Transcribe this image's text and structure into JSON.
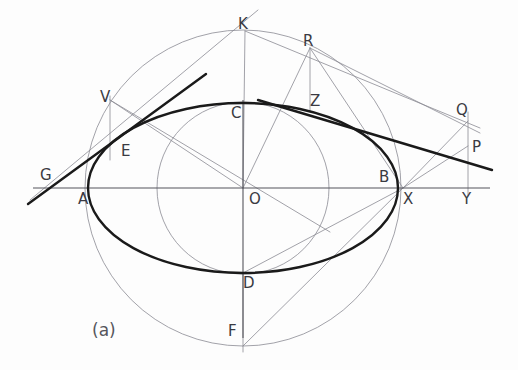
{
  "figure": {
    "caption": "(a)",
    "caption_x": 92,
    "caption_y": 322,
    "width": 518,
    "height": 370,
    "background": "#fdfdfd"
  },
  "style": {
    "bold_stroke": "#1a1a1a",
    "thin_stroke": "#8a8a93",
    "medium_stroke": "#55555c",
    "label_color": "#3a3a42",
    "bold_width": 2.4,
    "thin_width": 0.8,
    "medium_width": 1.1
  },
  "geometry": {
    "center": {
      "x": 243,
      "y": 188,
      "label": "O"
    },
    "ellipse": {
      "cx": 243,
      "cy": 188,
      "rx": 155,
      "ry": 85
    },
    "major_circle": {
      "cx": 243,
      "cy": 188,
      "r": 158
    },
    "minor_circle": {
      "cx": 243,
      "cy": 188,
      "r": 86
    },
    "axis_horizontal": {
      "x1": 33,
      "y1": 188,
      "x2": 490,
      "y2": 188
    },
    "axis_vertical": {
      "x1": 243,
      "y1": 100,
      "x2": 243,
      "y2": 338
    }
  },
  "points": [
    {
      "name": "A",
      "x": 88,
      "y": 188,
      "label_x": 78,
      "label_y": 192
    },
    {
      "name": "B",
      "x": 398,
      "y": 188,
      "label_x": 379,
      "label_y": 170
    },
    {
      "name": "C",
      "x": 243,
      "y": 103,
      "label_x": 231,
      "label_y": 106
    },
    {
      "name": "D",
      "x": 243,
      "y": 273,
      "label_x": 243,
      "label_y": 276
    },
    {
      "name": "E",
      "x": 118,
      "y": 142,
      "label_x": 121,
      "label_y": 144
    },
    {
      "name": "F",
      "x": 243,
      "y": 346,
      "label_x": 228,
      "label_y": 324
    },
    {
      "name": "G",
      "x": 45,
      "y": 182,
      "label_x": 40,
      "label_y": 168
    },
    {
      "name": "K",
      "x": 245,
      "y": 31,
      "label_x": 238,
      "label_y": 17
    },
    {
      "name": "O",
      "x": 243,
      "y": 188,
      "label_x": 249,
      "label_y": 192
    },
    {
      "name": "P",
      "x": 468,
      "y": 146,
      "label_x": 472,
      "label_y": 140
    },
    {
      "name": "Q",
      "x": 468,
      "y": 121,
      "label_x": 456,
      "label_y": 103
    },
    {
      "name": "R",
      "x": 310,
      "y": 48,
      "label_x": 303,
      "label_y": 34
    },
    {
      "name": "V",
      "x": 110,
      "y": 100,
      "label_x": 100,
      "label_y": 90
    },
    {
      "name": "X",
      "x": 403,
      "y": 188,
      "label_x": 403,
      "label_y": 192
    },
    {
      "name": "Y",
      "x": 468,
      "y": 188,
      "label_x": 462,
      "label_y": 192
    },
    {
      "name": "Z",
      "x": 313,
      "y": 104,
      "label_x": 310,
      "label_y": 94
    }
  ],
  "thin_lines": [
    {
      "name": "ordinate-V-E",
      "x1": 110,
      "y1": 96,
      "x2": 110,
      "y2": 160
    },
    {
      "name": "ordinate-R-Z",
      "x1": 310,
      "y1": 48,
      "x2": 310,
      "y2": 112
    },
    {
      "name": "ordinate-Q-Y",
      "x1": 468,
      "y1": 112,
      "x2": 468,
      "y2": 196
    },
    {
      "name": "radius-O-V",
      "x1": 243,
      "y1": 188,
      "x2": 110,
      "y2": 100
    },
    {
      "name": "radius-O-R",
      "x1": 243,
      "y1": 188,
      "x2": 310,
      "y2": 48
    },
    {
      "name": "radius-O-K",
      "x1": 243,
      "y1": 188,
      "x2": 245,
      "y2": 31
    },
    {
      "name": "chord-V-E-ext",
      "x1": 110,
      "y1": 100,
      "x2": 330,
      "y2": 232
    },
    {
      "name": "ray-X-R",
      "x1": 403,
      "y1": 188,
      "x2": 310,
      "y2": 48
    },
    {
      "name": "ray-X-Q",
      "x1": 403,
      "y1": 188,
      "x2": 468,
      "y2": 121
    },
    {
      "name": "ray-X-P",
      "x1": 403,
      "y1": 188,
      "x2": 468,
      "y2": 146
    },
    {
      "name": "ray-X-D",
      "x1": 403,
      "y1": 188,
      "x2": 243,
      "y2": 273
    },
    {
      "name": "ray-X-F",
      "x1": 403,
      "y1": 188,
      "x2": 243,
      "y2": 346
    },
    {
      "name": "ray-K-Q",
      "x1": 245,
      "y1": 31,
      "x2": 480,
      "y2": 128
    },
    {
      "name": "ray-R-Q",
      "x1": 310,
      "y1": 48,
      "x2": 480,
      "y2": 133
    },
    {
      "name": "ray-G-K",
      "x1": 30,
      "y1": 200,
      "x2": 258,
      "y2": 10
    },
    {
      "name": "ray-D-F-down",
      "x1": 243,
      "y1": 273,
      "x2": 243,
      "y2": 352
    }
  ],
  "bold_lines": [
    {
      "name": "tangent-at-E",
      "x1": 28,
      "y1": 204,
      "x2": 206,
      "y2": 74
    },
    {
      "name": "tangent-at-Z",
      "x1": 258,
      "y1": 100,
      "x2": 492,
      "y2": 170
    }
  ],
  "labels_note": "Point letters rendered beside their construction positions"
}
